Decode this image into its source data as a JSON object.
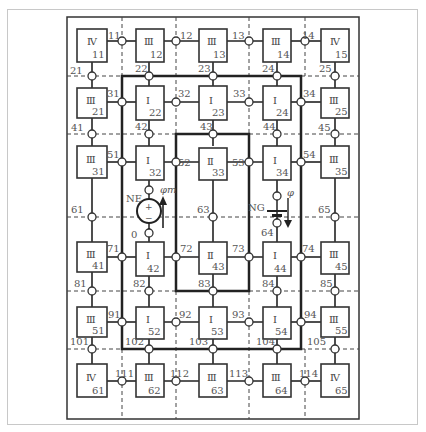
{
  "diagram": {
    "title": "",
    "annotations": {
      "ne_label": "NE",
      "zero_label": "0",
      "ng_label": "NG",
      "phi_m_label": "φm",
      "phi_label": "φ",
      "source_plus": "+",
      "source_minus": "−"
    },
    "cells": [
      {
        "id": "11",
        "class": "Ⅳ",
        "num": "11"
      },
      {
        "id": "12",
        "class": "Ⅲ",
        "num": "12"
      },
      {
        "id": "13",
        "class": "Ⅲ",
        "num": "13"
      },
      {
        "id": "14",
        "class": "Ⅲ",
        "num": "14"
      },
      {
        "id": "15",
        "class": "Ⅳ",
        "num": "15"
      },
      {
        "id": "21",
        "class": "Ⅲ",
        "num": "21"
      },
      {
        "id": "22",
        "class": "Ⅰ",
        "num": "22"
      },
      {
        "id": "23",
        "class": "Ⅰ",
        "num": "23"
      },
      {
        "id": "24",
        "class": "Ⅰ",
        "num": "24"
      },
      {
        "id": "25",
        "class": "Ⅲ",
        "num": "25"
      },
      {
        "id": "31",
        "class": "Ⅲ",
        "num": "31"
      },
      {
        "id": "32",
        "class": "Ⅰ",
        "num": "32"
      },
      {
        "id": "33",
        "class": "Ⅱ",
        "num": "33"
      },
      {
        "id": "34",
        "class": "Ⅰ",
        "num": "34"
      },
      {
        "id": "35",
        "class": "Ⅲ",
        "num": "35"
      },
      {
        "id": "41",
        "class": "Ⅲ",
        "num": "41"
      },
      {
        "id": "42",
        "class": "Ⅰ",
        "num": "42"
      },
      {
        "id": "43",
        "class": "Ⅱ",
        "num": "43"
      },
      {
        "id": "44",
        "class": "Ⅰ",
        "num": "44"
      },
      {
        "id": "45",
        "class": "Ⅲ",
        "num": "45"
      },
      {
        "id": "51",
        "class": "Ⅲ",
        "num": "51"
      },
      {
        "id": "52",
        "class": "Ⅰ",
        "num": "52"
      },
      {
        "id": "53",
        "class": "Ⅰ",
        "num": "53"
      },
      {
        "id": "54",
        "class": "Ⅰ",
        "num": "54"
      },
      {
        "id": "55",
        "class": "Ⅲ",
        "num": "55"
      },
      {
        "id": "61",
        "class": "Ⅳ",
        "num": "61"
      },
      {
        "id": "62",
        "class": "Ⅲ",
        "num": "62"
      },
      {
        "id": "63",
        "class": "Ⅲ",
        "num": "63"
      },
      {
        "id": "64",
        "class": "Ⅲ",
        "num": "64"
      },
      {
        "id": "65",
        "class": "Ⅳ",
        "num": "65"
      }
    ],
    "nodes": {
      "n11": "11",
      "n12": "12",
      "n13": "13",
      "n14": "14",
      "n21": "21",
      "n22": "22",
      "n23": "23",
      "n24": "24",
      "n25": "25",
      "n31": "31",
      "n32": "32",
      "n33": "33",
      "n34": "34",
      "n41": "41",
      "n42": "42",
      "n43": "43",
      "n44": "44",
      "n45": "45",
      "n51": "51",
      "n52": "52",
      "n53": "53",
      "n54": "54",
      "n61": "61",
      "n63": "63",
      "n64": "64",
      "n65": "65",
      "n71": "71",
      "n72": "72",
      "n73": "73",
      "n74": "74",
      "n81": "81",
      "n82": "82",
      "n83": "83",
      "n84": "84",
      "n85": "85",
      "n91": "91",
      "n92": "92",
      "n93": "93",
      "n94": "94",
      "n101": "101",
      "n102": "102",
      "n103": "103",
      "n104": "104",
      "n105": "105",
      "n111": "111",
      "n112": "112",
      "n113": "113",
      "n114": "114"
    }
  }
}
